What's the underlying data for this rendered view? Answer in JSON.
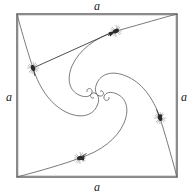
{
  "figure": {
    "kind": "geometric-diagram",
    "background_color": "#ffffff",
    "square": {
      "side_label": "a",
      "stroke_color": "#4a4a4a",
      "stroke_width": 1.2,
      "left": 17,
      "top": 14,
      "right": 177,
      "bottom": 177
    },
    "labels": {
      "top": "a",
      "right": "a",
      "bottom": "a",
      "left": "a"
    },
    "curves": {
      "stroke_color": "#6b6b6b",
      "stroke_width": 0.9,
      "count": 4,
      "type": "logarithmic-spiral-pursuit",
      "center_x": 97,
      "center_y": 95.5
    },
    "chord": {
      "stroke_color": "#3a3a3a",
      "stroke_width": 0.9,
      "from_bug": "left",
      "to_bug": "top"
    },
    "bugs": [
      {
        "id": "bug-top",
        "x": 116,
        "y": 31,
        "heading_deg": 20
      },
      {
        "id": "bug-right",
        "x": 160,
        "y": 118,
        "heading_deg": 110
      },
      {
        "id": "bug-bottom",
        "x": 80,
        "y": 158,
        "heading_deg": 200
      },
      {
        "id": "bug-left",
        "x": 33,
        "y": 68,
        "heading_deg": 290
      }
    ],
    "bug_style": {
      "body_color": "#2a2a2a",
      "splat_color": "#8a8a8a",
      "size": 9
    }
  }
}
